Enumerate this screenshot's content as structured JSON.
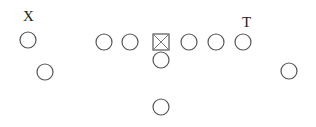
{
  "diagram": {
    "type": "football-formation",
    "labels": {
      "x_receiver": "X",
      "tight_end": "T"
    },
    "players": [
      {
        "id": "x-receiver",
        "role": "X",
        "labeled": true
      },
      {
        "id": "slot-back",
        "role": "wingback-left",
        "labeled": false
      },
      {
        "id": "left-tackle",
        "role": "OL",
        "labeled": false
      },
      {
        "id": "left-guard",
        "role": "OL",
        "labeled": false
      },
      {
        "id": "center",
        "role": "C",
        "labeled": false,
        "symbol": "boxed-x"
      },
      {
        "id": "right-guard",
        "role": "OL",
        "labeled": false
      },
      {
        "id": "right-tackle",
        "role": "OL",
        "labeled": false
      },
      {
        "id": "tight-end",
        "role": "T",
        "labeled": true
      },
      {
        "id": "quarterback",
        "role": "QB",
        "labeled": false
      },
      {
        "id": "running-back",
        "role": "RB",
        "labeled": false
      },
      {
        "id": "flanker",
        "role": "wingback-right",
        "labeled": false
      }
    ]
  }
}
